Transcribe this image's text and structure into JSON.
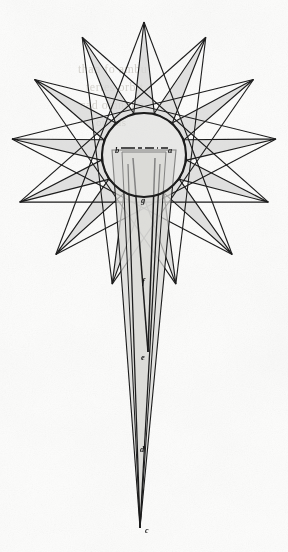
{
  "figure": {
    "kind": "comet-orbit-star-diagram",
    "background_color": "#fdfdfc",
    "fill_color": "#d9d9d7",
    "stroke_color": "#1b1b1b",
    "circle": {
      "cx": 144,
      "cy": 155,
      "r": 42,
      "stroke_width": 2.1
    },
    "star": {
      "points": 13,
      "center": [
        144,
        155
      ],
      "outer_radius": 133,
      "inner_radius": 43,
      "rotation_deg": -90,
      "skip": 5
    },
    "tail": {
      "apex": [
        140,
        528
      ],
      "left_base": [
        118,
        150
      ],
      "right_base": [
        170,
        150
      ]
    }
  },
  "labels": [
    {
      "id": "label-a",
      "text": "a",
      "x": 170,
      "y": 150,
      "size": 8.5
    },
    {
      "id": "label-b",
      "text": "b",
      "x": 117,
      "y": 150,
      "size": 8.5
    },
    {
      "id": "label-g",
      "text": "g",
      "x": 143,
      "y": 200,
      "size": 8.5
    },
    {
      "id": "label-f",
      "text": "f",
      "x": 143,
      "y": 281,
      "size": 8.5
    },
    {
      "id": "label-e",
      "text": "e",
      "x": 143,
      "y": 357,
      "size": 8.5
    },
    {
      "id": "label-d",
      "text": "d",
      "x": 142,
      "y": 449,
      "size": 8.5
    },
    {
      "id": "label-c",
      "text": "c",
      "x": 146,
      "y": 531,
      "size": 8.0
    }
  ],
  "diameter": {
    "from": [
      121,
      148
    ],
    "to": [
      168,
      148
    ],
    "style": "dash-dot",
    "stroke_width": 1.6
  },
  "showthrough": [
    {
      "id": "ghost-line-1",
      "text": "than fo ambu",
      "x": 78,
      "y": 70,
      "size": 12
    },
    {
      "id": "ghost-line-2",
      "text": "tertes orbit",
      "x": 86,
      "y": 88,
      "size": 12
    },
    {
      "id": "ghost-line-3",
      "text": "cad omnium",
      "x": 80,
      "y": 106,
      "size": 12
    },
    {
      "id": "ghost-line-4",
      "text": "oribus",
      "x": 96,
      "y": 124,
      "size": 11
    }
  ]
}
